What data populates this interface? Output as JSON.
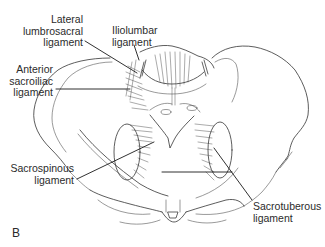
{
  "figure": {
    "panel_letter": "B",
    "labels": {
      "lateral_lumbosacral": "Lateral\nlumbrosacral\nligament",
      "iliolumbar": "Iliolumbar\nligament",
      "anterior_sacroiliac": "Anterior\nsacroiliac\nligament",
      "sacrospinous": "Sacrospinous\nligament",
      "sacrotuberous": "Sacrotuberous\nligament"
    },
    "colors": {
      "line_art": "#333333",
      "text": "#2b2b2b",
      "background": "#ffffff"
    }
  }
}
